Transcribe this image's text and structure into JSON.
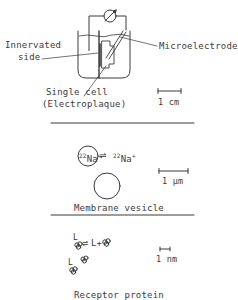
{
  "panels": [
    {
      "id": "cell",
      "labels": {
        "innervated_side_line1": "Innervated",
        "innervated_side_line2": "side",
        "microelectrode": "Microelectrode",
        "single_cell_line1": "Single cell",
        "single_cell_line2": "(Electroplaque)"
      },
      "scale_bar": "1 cm"
    },
    {
      "id": "vesicle",
      "labels": {
        "inside_isotope": "22",
        "inside_ion": "Na",
        "inside_charge": "+",
        "equilibrium_arrow": "⇌",
        "outside_isotope": "22",
        "outside_ion": "Na",
        "outside_charge": "+",
        "caption": "Membrane vesicle"
      },
      "scale_bar": "1 µm"
    },
    {
      "id": "receptor",
      "labels": {
        "ligand_bound": "L",
        "equilibrium_arrow": "⇌",
        "free_ligand_plus": "L+",
        "ligand_bound_2": "L",
        "caption": "Receptor protein"
      },
      "scale_bar": "1 nm"
    }
  ],
  "colors": {
    "ink": "#3a3a3a",
    "background": "#ffffff"
  }
}
